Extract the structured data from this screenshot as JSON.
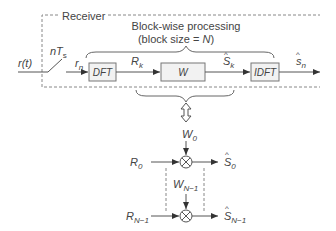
{
  "diagram": {
    "receiver_label": "Receiver",
    "processing_title": "Block-wise processing",
    "processing_subtitle": "(block size = N)",
    "input_signal": "r(t)",
    "sampler_label": "nT",
    "sampler_sub": "s",
    "sampled_signal": "r",
    "sampled_sub": "n",
    "blocks": [
      {
        "id": "dft",
        "label": "DFT"
      },
      {
        "id": "w",
        "label": "W"
      },
      {
        "id": "idft",
        "label": "IDFT"
      }
    ],
    "signals": {
      "rk": "R",
      "rk_sub": "k",
      "sk": "S",
      "sk_sub": "k",
      "sn": "s",
      "sn_sub": "n"
    },
    "expanded": {
      "w0": "W",
      "w0_sub": "0",
      "wn1": "W",
      "wn1_sub": "N−1",
      "r0": "R",
      "r0_sub": "0",
      "rn1": "R",
      "rn1_sub": "N−1",
      "s0": "S",
      "s0_sub": "0",
      "sn1": "S",
      "sn1_sub": "N−1"
    },
    "colors": {
      "line": "#555555",
      "box_fill": "#f2f2f2",
      "box_stroke": "#777777",
      "dash": "#888888"
    }
  }
}
